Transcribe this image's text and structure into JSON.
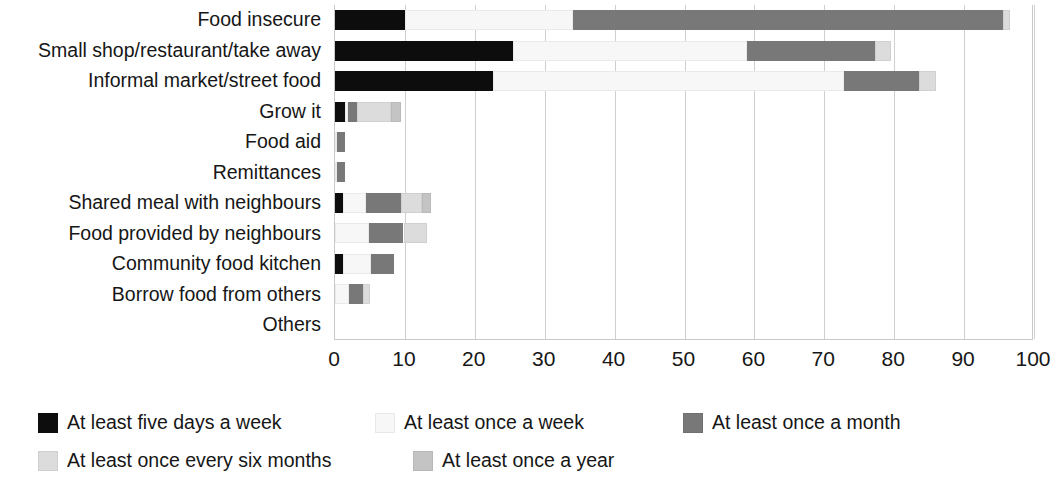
{
  "chart_data": {
    "type": "bar",
    "orientation": "horizontal",
    "stacked": true,
    "title": "",
    "xlabel": "",
    "ylabel": "",
    "xlim": [
      0,
      100
    ],
    "xticks": [
      0,
      10,
      20,
      30,
      40,
      50,
      60,
      70,
      80,
      90,
      100
    ],
    "xtick_labels": [
      "0",
      "10",
      "20",
      "30",
      "40",
      "50",
      "60",
      "70",
      "80",
      "90",
      "100"
    ],
    "grid": true,
    "legend_position": "bottom",
    "categories": [
      "Food insecure",
      "Small shop/restaurant/take away",
      "Informal market/street food",
      "Grow it",
      "Food aid",
      "Remittances",
      "Shared meal with neighbours",
      "Food provided by neighbours",
      "Community food kitchen",
      "Borrow food from others",
      "Others"
    ],
    "series": [
      {
        "name": "At least five days a week",
        "color": "#0d0d0d",
        "values": [
          10.0,
          25.5,
          22.6,
          1.5,
          0.0,
          0.0,
          1.2,
          0.0,
          1.2,
          0.0,
          0.0
        ]
      },
      {
        "name": "At least once a week",
        "color": "#f7f7f7",
        "values": [
          24.0,
          33.5,
          50.2,
          0.4,
          0.3,
          0.3,
          3.3,
          4.8,
          4.0,
          2.0,
          0.0
        ]
      },
      {
        "name": "At least once a month",
        "color": "#787878",
        "values": [
          61.5,
          18.3,
          10.7,
          1.2,
          1.2,
          1.2,
          5.0,
          5.0,
          3.2,
          2.0,
          0.0
        ]
      },
      {
        "name": "At least once every six months",
        "color": "#dcdcdc",
        "values": [
          1.0,
          2.2,
          2.5,
          4.9,
          0.0,
          0.0,
          2.9,
          3.3,
          0.0,
          1.0,
          0.0
        ]
      },
      {
        "name": "At least once a year",
        "color": "#c4c4c4",
        "values": [
          0.0,
          0.0,
          0.0,
          1.5,
          0.0,
          0.0,
          1.4,
          0.0,
          0.0,
          0.0,
          0.0
        ]
      }
    ],
    "totals": [
      96.5,
      79.5,
      86.0,
      9.5,
      1.5,
      1.5,
      13.8,
      13.1,
      8.4,
      5.0,
      0.0
    ]
  }
}
